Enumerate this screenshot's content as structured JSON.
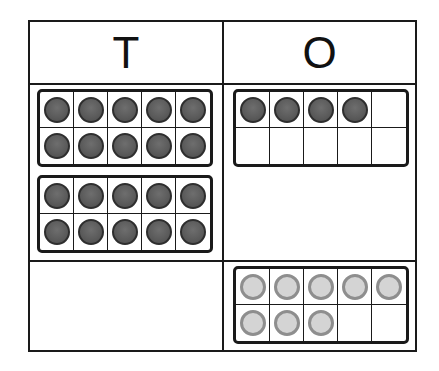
{
  "chart": {
    "columns": [
      {
        "label": "T",
        "meaning": "tens"
      },
      {
        "label": "O",
        "meaning": "ones"
      }
    ],
    "rows": [
      {
        "tens": {
          "frames": [
            {
              "filled": 10,
              "color": "dark"
            },
            {
              "filled": 10,
              "color": "dark"
            }
          ]
        },
        "ones": {
          "frames": [
            {
              "filled": 4,
              "color": "dark"
            }
          ]
        }
      },
      {
        "tens": {
          "frames": []
        },
        "ones": {
          "frames": [
            {
              "filled": 8,
              "color": "light"
            }
          ]
        }
      }
    ]
  },
  "colors": {
    "dark_counter": "#5a5a5a",
    "light_counter": "#d4d4d4",
    "light_counter_border": "#8e8e8e",
    "line": "#1a1a1a"
  }
}
